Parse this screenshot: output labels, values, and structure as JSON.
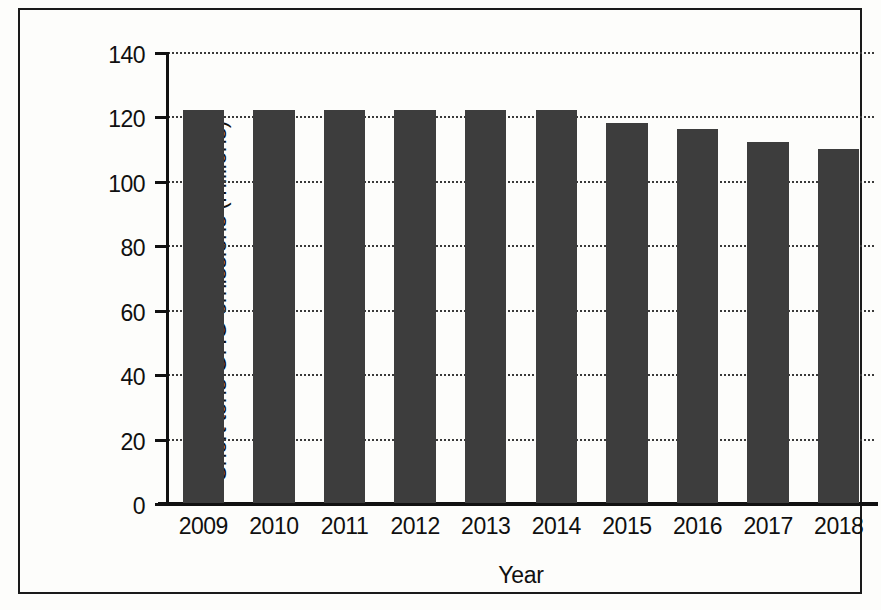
{
  "chart_data": {
    "type": "bar",
    "title": "",
    "subtitle": "",
    "xlabel": "Year",
    "ylabel": "Short tons GHG emissions (millions)",
    "categories": [
      "2009",
      "2010",
      "2011",
      "2012",
      "2013",
      "2014",
      "2015",
      "2016",
      "2017",
      "2018"
    ],
    "values": [
      122,
      122,
      122,
      122,
      122,
      122,
      118,
      116,
      112,
      110
    ],
    "series": [
      {
        "name": "Short tons GHG emissions (millions)",
        "values": [
          122,
          122,
          122,
          122,
          122,
          122,
          118,
          116,
          112,
          110
        ]
      }
    ],
    "ylim": [
      0,
      140
    ],
    "yticks": [
      0,
      20,
      40,
      60,
      80,
      100,
      120,
      140
    ],
    "ytick_labels": [
      "0",
      "20",
      "40",
      "60",
      "80",
      "100",
      "120",
      "140"
    ],
    "xticks": [
      "2009",
      "2010",
      "2011",
      "2012",
      "2013",
      "2014",
      "2015",
      "2016",
      "2017",
      "2018"
    ],
    "grid": true,
    "grid_axis": "y",
    "grid_style": "dotted",
    "legend": false,
    "legend_position": "none",
    "bar_color": "#3d3d3d",
    "axis_color": "#111111",
    "grid_color": "#3a3a3a",
    "background_color": "#fdfdfb",
    "annotations": []
  },
  "figure": {
    "frame_border_color": "#1a1a1a"
  }
}
